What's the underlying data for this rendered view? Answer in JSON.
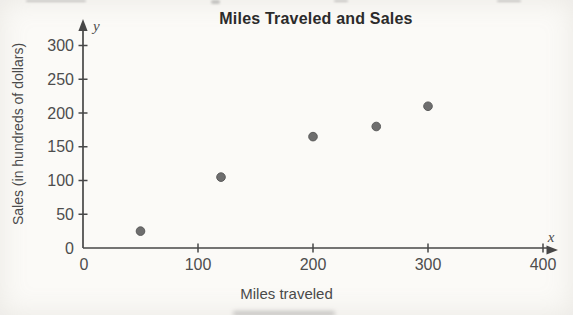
{
  "figure": {
    "title": "Miles Traveled and Sales",
    "xlabel": "Miles traveled",
    "ylabel": "Sales (in hundreds of dollars)",
    "x_axis_letter": "x",
    "y_axis_letter": "y"
  },
  "chart_data": {
    "type": "scatter",
    "title": "Miles Traveled and Sales",
    "xlabel": "Miles traveled",
    "ylabel": "Sales (in hundreds of dollars)",
    "points": [
      {
        "x": 50,
        "y": 25
      },
      {
        "x": 120,
        "y": 105
      },
      {
        "x": 200,
        "y": 165
      },
      {
        "x": 255,
        "y": 180
      },
      {
        "x": 300,
        "y": 210
      }
    ],
    "xlim": [
      0,
      400
    ],
    "ylim": [
      0,
      300
    ],
    "x_ticks": [
      0,
      100,
      200,
      300,
      400
    ],
    "y_ticks": [
      0,
      50,
      100,
      150,
      200,
      250,
      300
    ],
    "grid": false,
    "legend": null,
    "colors": {
      "point": "#6e6e6e",
      "point_edge": "#5c5c5c",
      "axis": "#474747",
      "tick_label": "#4d4d4d",
      "background": "#fbfaf7"
    }
  }
}
